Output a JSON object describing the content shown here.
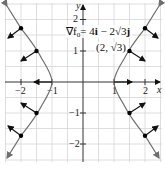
{
  "diagram": {
    "equation_label": "∇f₀ = 4i − 2√3j",
    "equation_parts": {
      "nabla": "∇f",
      "sub": "0",
      "rhs": "= 4",
      "i": "i",
      "mid": " − 2√3",
      "j": "j"
    },
    "point_label": "(2, √3)",
    "axes": {
      "x_label": "x",
      "y_label": "y",
      "x_ticks": [
        "−2",
        "−1",
        "1",
        "2"
      ],
      "y_ticks": [
        "2",
        "1",
        "−1",
        "−2"
      ]
    },
    "colors": {
      "grid": "#d6d6d6",
      "axis": "#333333",
      "curve": "#6e6e6e",
      "vector": "#111111",
      "point": "#000000"
    },
    "points": [
      {
        "x": 1,
        "y": 0
      },
      {
        "x": 1.5,
        "y": 1.118
      },
      {
        "x": 2,
        "y": 1.732
      },
      {
        "x": 1.5,
        "y": -1.118
      },
      {
        "x": 2,
        "y": -1.732
      },
      {
        "x": -1,
        "y": 0
      },
      {
        "x": -1.5,
        "y": 1.118
      },
      {
        "x": -2,
        "y": 1.732
      },
      {
        "x": -1.5,
        "y": -1.118
      },
      {
        "x": -2,
        "y": -1.732
      }
    ]
  }
}
